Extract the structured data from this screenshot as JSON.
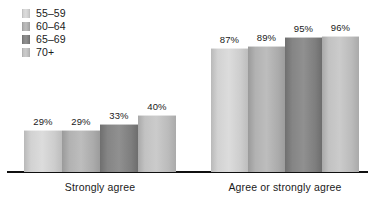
{
  "chart_data": {
    "type": "bar",
    "title": "",
    "subtitle": "",
    "xlabel": "",
    "ylabel": "",
    "ylim": [
      0,
      100
    ],
    "grid": false,
    "legend_position": "top-left",
    "categories": [
      "Strongly agree",
      "Agree or strongly agree"
    ],
    "value_suffix": "%",
    "series": [
      {
        "name": "55–59",
        "color": "#d9d9d9",
        "values": [
          29,
          87
        ],
        "labels": [
          "29%",
          "87%"
        ]
      },
      {
        "name": "60–64",
        "color": "#b3b3b3",
        "values": [
          29,
          89
        ],
        "labels": [
          "29%",
          "89%"
        ]
      },
      {
        "name": "65–69",
        "color": "#8c8c8c",
        "values": [
          33,
          95
        ],
        "labels": [
          "33%",
          "95%"
        ]
      },
      {
        "name": "70+",
        "color": "#c6c6c6",
        "values": [
          40,
          96
        ],
        "labels": [
          "40%",
          "96%"
        ]
      }
    ]
  },
  "legend": {
    "items": [
      {
        "label": "55–59",
        "swatch_color": "#d9d9d9"
      },
      {
        "label": "60–64",
        "swatch_color": "#b3b3b3"
      },
      {
        "label": "65–69",
        "swatch_color": "#8c8c8c"
      },
      {
        "label": "70+",
        "swatch_color": "#c6c6c6"
      }
    ]
  },
  "axis": {
    "baseline_color": "#101010"
  }
}
